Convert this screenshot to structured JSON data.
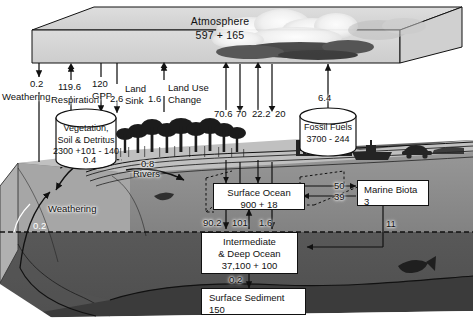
{
  "diagram": {
    "colors": {
      "deep_ocean": "#595959",
      "surface_ocean": "#8a8a8a",
      "land": "#c9c9c9",
      "sediment": "#3d3d3d",
      "atmosphere_slab": "#d4d4d4",
      "box_fill": "#ffffff",
      "stroke": "#111111"
    }
  },
  "reservoirs": {
    "atmosphere": {
      "name": "Atmosphere",
      "value": "597 + 165"
    },
    "vegetation": {
      "name_line1": "Vegetation,",
      "name_line2": "Soil & Detritus",
      "value": "2300 +101 - 140"
    },
    "fossil_fuels": {
      "name": "Fossil Fuels",
      "value": "3700 - 244"
    },
    "surface_ocean": {
      "name": "Surface Ocean",
      "value": "900 + 18"
    },
    "marine_biota": {
      "name": "Marine Biota",
      "value": "3"
    },
    "deep_ocean": {
      "name_line1": "Intermediate",
      "name_line2": "& Deep Ocean",
      "value": "37,100 + 100"
    },
    "surface_sediment": {
      "name": "Surface Sediment",
      "value": "150"
    }
  },
  "fluxes": {
    "weathering_atm": {
      "value": "0.2",
      "label": "Weathering"
    },
    "respiration": {
      "value": "119.6",
      "label": "Respiration"
    },
    "gpp": {
      "value": "120",
      "label": "GPP"
    },
    "land_sink": {
      "value": "2.6",
      "label_line1": "Land",
      "label_line2": "Sink"
    },
    "land_use_change": {
      "value": "1.6",
      "label_line1": "Land Use",
      "label_line2": "Change"
    },
    "ocean_atm_up_a": {
      "value": "70.6"
    },
    "ocean_atm_down_a": {
      "value": "70"
    },
    "ocean_atm_up_b": {
      "value": "22.2"
    },
    "ocean_atm_down_b": {
      "value": "20"
    },
    "fossil_emission": {
      "value": "6.4"
    },
    "veg_weathering": {
      "value": "0.4"
    },
    "rivers": {
      "value": "0.8",
      "label": "Rivers"
    },
    "weathering_ocean": {
      "value": "0.2",
      "label": "Weathering"
    },
    "biota_export_out": {
      "value": "50"
    },
    "biota_export_in": {
      "value": "39"
    },
    "biota_to_deep": {
      "value": "11"
    },
    "surf_to_deep": {
      "value": "90.2"
    },
    "deep_to_surf": {
      "value": "101"
    },
    "deep_uptake": {
      "value": "1.6"
    },
    "deep_to_sediment": {
      "value": "0.2"
    }
  }
}
